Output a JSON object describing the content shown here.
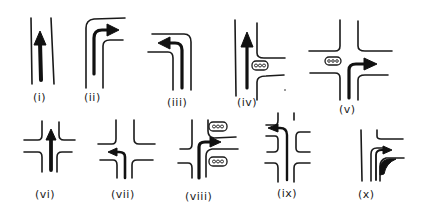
{
  "diagram": {
    "type": "road-movement-pictograms",
    "style": "hand-drawn black ink on white",
    "colors": {
      "ink": "#1a1a1a",
      "background": "#ffffff"
    },
    "panels": [
      {
        "id": "i",
        "label": "(i)",
        "description": "straight road, through movement arrow"
      },
      {
        "id": "ii",
        "label": "(ii)",
        "description": "road bending right, right-turn arrow"
      },
      {
        "id": "iii",
        "label": "(iii)",
        "description": "road bending left, left-turn arrow"
      },
      {
        "id": "iv",
        "label": "(iv)",
        "description": "T-junction with signal on side road, straight-through arrow"
      },
      {
        "id": "v",
        "label": "(v)",
        "description": "crossroads with signal, right-turn arrow"
      },
      {
        "id": "vi",
        "label": "(vi)",
        "description": "crossroads, straight-through arrow"
      },
      {
        "id": "vii",
        "label": "(vii)",
        "description": "crossroads, left-turn arrow"
      },
      {
        "id": "viii",
        "label": "(viii)",
        "description": "junction with two signals, right-turn arrow"
      },
      {
        "id": "ix",
        "label": "(ix)",
        "description": "staggered double junction, left-turn arrow"
      },
      {
        "id": "x",
        "label": "(x)",
        "description": "slip-lane right turn with filled merge wedge"
      }
    ]
  }
}
